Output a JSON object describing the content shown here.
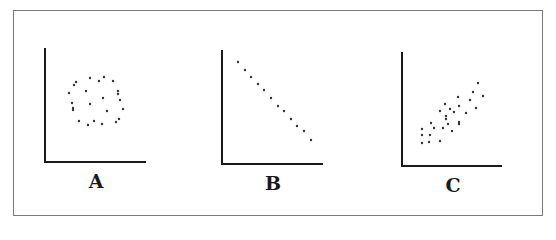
{
  "figure": {
    "colors": {
      "border": "#7a7a7a",
      "axis": "#1a1a1a",
      "dot": "#333333"
    }
  },
  "chart_data": [
    {
      "type": "scatter",
      "label": "A",
      "title": "",
      "xlabel": "",
      "ylabel": "",
      "grid": false,
      "note": "No correlation (points in circular cloud)",
      "axis": {
        "origin": [
          45,
          162
        ],
        "top": 48,
        "right": 146
      },
      "points": [
        [
          76,
          82
        ],
        [
          74,
          85
        ],
        [
          90,
          78
        ],
        [
          99,
          81
        ],
        [
          104,
          77
        ],
        [
          113,
          81
        ],
        [
          69,
          93
        ],
        [
          86,
          91
        ],
        [
          118,
          91
        ],
        [
          118,
          94
        ],
        [
          72,
          103
        ],
        [
          103,
          98
        ],
        [
          120,
          100
        ],
        [
          73,
          108
        ],
        [
          73,
          110
        ],
        [
          90,
          104
        ],
        [
          123,
          109
        ],
        [
          107,
          111
        ],
        [
          119,
          119
        ],
        [
          79,
          121
        ],
        [
          116,
          122
        ],
        [
          88,
          125
        ],
        [
          94,
          121
        ],
        [
          102,
          124
        ]
      ]
    },
    {
      "type": "scatter",
      "label": "B",
      "title": "",
      "xlabel": "",
      "ylabel": "",
      "grid": false,
      "note": "Perfect negative correlation",
      "axis": {
        "origin": [
          222,
          164
        ],
        "top": 50,
        "right": 323
      },
      "points": [
        [
          238,
          62
        ],
        [
          245,
          70
        ],
        [
          251,
          77
        ],
        [
          258,
          84
        ],
        [
          264,
          90
        ],
        [
          271,
          98
        ],
        [
          278,
          106
        ],
        [
          284,
          111
        ],
        [
          291,
          119
        ],
        [
          297,
          126
        ],
        [
          304,
          131
        ],
        [
          311,
          140
        ]
      ]
    },
    {
      "type": "scatter",
      "label": "C",
      "title": "",
      "xlabel": "",
      "ylabel": "",
      "grid": false,
      "note": "Positive correlation",
      "axis": {
        "origin": [
          402,
          166
        ],
        "top": 52,
        "right": 502
      },
      "points": [
        [
          478,
          83
        ],
        [
          473,
          92
        ],
        [
          483,
          96
        ],
        [
          458,
          97
        ],
        [
          470,
          100
        ],
        [
          459,
          106
        ],
        [
          445,
          104
        ],
        [
          476,
          108
        ],
        [
          466,
          113
        ],
        [
          450,
          109
        ],
        [
          454,
          112
        ],
        [
          440,
          111
        ],
        [
          446,
          116
        ],
        [
          459,
          122
        ],
        [
          459,
          124
        ],
        [
          431,
          123
        ],
        [
          446,
          119
        ],
        [
          448,
          124
        ],
        [
          443,
          128
        ],
        [
          452,
          131
        ],
        [
          434,
          128
        ],
        [
          422,
          129
        ],
        [
          422,
          135
        ],
        [
          430,
          135
        ],
        [
          422,
          143
        ],
        [
          429,
          142
        ],
        [
          440,
          141
        ]
      ]
    }
  ],
  "labels": {
    "a": "A",
    "b": "B",
    "c": "C"
  }
}
